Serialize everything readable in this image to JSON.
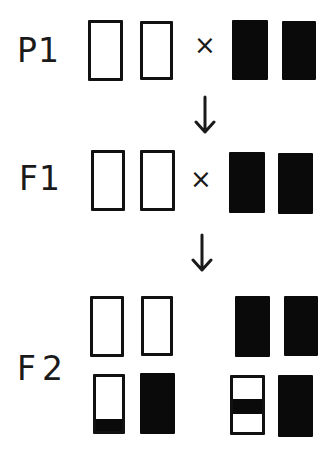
{
  "generations": [
    {
      "label": "P1",
      "cross_symbol": "×"
    },
    {
      "label": "F1",
      "cross_symbol": "×"
    },
    {
      "label": "F2"
    }
  ],
  "arrows": [
    "down-arrow",
    "down-arrow"
  ],
  "colors": {
    "ink": "#0a0a0a",
    "paper": "#ffffff"
  },
  "chromosomes": {
    "P1": [
      "white",
      "white",
      "black",
      "black"
    ],
    "F1": [
      "white",
      "white",
      "black",
      "black"
    ],
    "F2_top": [
      "white",
      "white",
      "black",
      "black"
    ],
    "F2_bottom": [
      "white-with-black-bottom-band",
      "black",
      "white-with-black-middle-band",
      "black"
    ]
  }
}
